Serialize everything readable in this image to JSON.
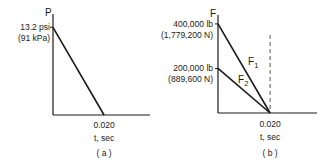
{
  "chart_data": [
    {
      "type": "line",
      "panel_label": "( a )",
      "ylabel": "P",
      "xlabel": "t,  sec",
      "x_ticks": [
        "0.020"
      ],
      "y_ticks": [
        {
          "value": 13.2,
          "label": "13.2 psi",
          "sublabel": "(91 kPa)"
        }
      ],
      "xlim": [
        0,
        0.038
      ],
      "ylim": [
        0,
        15.2
      ],
      "series": [
        {
          "name": "P",
          "x": [
            0,
            0.02
          ],
          "y": [
            13.2,
            0
          ]
        }
      ]
    },
    {
      "type": "line",
      "panel_label": "( b )",
      "ylabel": "F",
      "xlabel": "t,  sec",
      "x_ticks": [
        "0.020"
      ],
      "y_ticks": [
        {
          "value": 400000,
          "label": "400,000 lb",
          "sublabel": "(1,779,200 N)"
        },
        {
          "value": 200000,
          "label": "200,000 lb",
          "sublabel": "(889,600 N)"
        }
      ],
      "xlim": [
        0,
        0.038
      ],
      "ylim": [
        0,
        440000
      ],
      "series": [
        {
          "name": "F",
          "sub": "1",
          "x": [
            0,
            0.02
          ],
          "y": [
            400000,
            0
          ]
        },
        {
          "name": "F",
          "sub": "2",
          "x": [
            0,
            0.02
          ],
          "y": [
            200000,
            0
          ]
        }
      ],
      "annotations": [
        {
          "type": "dashed-vertical",
          "x": 0.02
        }
      ]
    }
  ]
}
